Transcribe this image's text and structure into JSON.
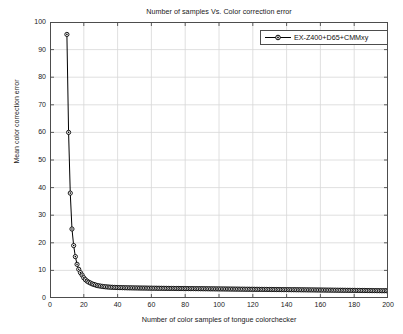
{
  "chart_data": {
    "type": "line",
    "title": "Number of samples Vs. Color correction error",
    "xlabel": "Number of color samples of tongue colorchecker",
    "ylabel": "Mean color correction error",
    "xlim": [
      0,
      200
    ],
    "ylim": [
      0,
      100
    ],
    "xticks": [
      0,
      20,
      40,
      60,
      80,
      100,
      120,
      140,
      160,
      180,
      200
    ],
    "yticks": [
      0,
      10,
      20,
      30,
      40,
      50,
      60,
      70,
      80,
      90,
      100
    ],
    "grid": "on",
    "legend_position": "top-right",
    "series": [
      {
        "name": "EX-Z400+D65+CMMxy",
        "color": "#000000",
        "marker": "circle",
        "line_style": "solid",
        "x": [
          10,
          11,
          12,
          13,
          14,
          15,
          16,
          17,
          18,
          19,
          20,
          21,
          22,
          23,
          24,
          25,
          26,
          27,
          28,
          29,
          30,
          31,
          32,
          33,
          34,
          35,
          36,
          37,
          38,
          39,
          40,
          41,
          42,
          43,
          44,
          45,
          46,
          47,
          48,
          49,
          50,
          51,
          52,
          53,
          54,
          55,
          56,
          57,
          58,
          59,
          60,
          61,
          62,
          63,
          64,
          65,
          66,
          67,
          68,
          69,
          70,
          71,
          72,
          73,
          74,
          75,
          76,
          77,
          78,
          79,
          80,
          81,
          82,
          83,
          84,
          85,
          86,
          87,
          88,
          89,
          90,
          91,
          92,
          93,
          94,
          95,
          96,
          97,
          98,
          99,
          100,
          101,
          102,
          103,
          104,
          105,
          106,
          107,
          108,
          109,
          110,
          111,
          112,
          113,
          114,
          115,
          116,
          117,
          118,
          119,
          120,
          121,
          122,
          123,
          124,
          125,
          126,
          127,
          128,
          129,
          130,
          131,
          132,
          133,
          134,
          135,
          136,
          137,
          138,
          139,
          140,
          141,
          142,
          143,
          144,
          145,
          146,
          147,
          148,
          149,
          150,
          151,
          152,
          153,
          154,
          155,
          156,
          157,
          158,
          159,
          160,
          161,
          162,
          163,
          164,
          165,
          166,
          167,
          168,
          169,
          170,
          171,
          172,
          173,
          174,
          175,
          176,
          177,
          178,
          179,
          180,
          181,
          182,
          183,
          184,
          185,
          186,
          187,
          188,
          189,
          190,
          191,
          192,
          193,
          194,
          195,
          196,
          197,
          198,
          199,
          200
        ],
        "y": [
          95.5,
          60.0,
          38.0,
          25.0,
          19.0,
          15.0,
          12.2,
          10.4,
          9.2,
          8.3,
          7.3,
          6.6,
          6.1,
          5.7,
          5.4,
          5.1,
          4.9,
          4.7,
          4.5,
          4.4,
          4.3,
          4.2,
          4.1,
          4.05,
          4.0,
          3.95,
          3.9,
          3.88,
          3.85,
          3.82,
          3.8,
          3.78,
          3.76,
          3.74,
          3.72,
          3.7,
          3.69,
          3.68,
          3.67,
          3.66,
          3.65,
          3.64,
          3.63,
          3.62,
          3.61,
          3.6,
          3.6,
          3.59,
          3.58,
          3.57,
          3.56,
          3.55,
          3.55,
          3.54,
          3.53,
          3.52,
          3.52,
          3.51,
          3.5,
          3.5,
          3.49,
          3.48,
          3.48,
          3.47,
          3.46,
          3.46,
          3.45,
          3.44,
          3.44,
          3.43,
          3.42,
          3.42,
          3.41,
          3.4,
          3.4,
          3.39,
          3.38,
          3.38,
          3.37,
          3.36,
          3.36,
          3.35,
          3.34,
          3.34,
          3.33,
          3.32,
          3.32,
          3.31,
          3.3,
          3.3,
          3.29,
          3.28,
          3.28,
          3.27,
          3.26,
          3.26,
          3.25,
          3.24,
          3.24,
          3.23,
          3.22,
          3.22,
          3.21,
          3.2,
          3.2,
          3.19,
          3.18,
          3.18,
          3.17,
          3.16,
          3.16,
          3.15,
          3.14,
          3.14,
          3.13,
          3.12,
          3.12,
          3.11,
          3.1,
          3.1,
          3.09,
          3.08,
          3.08,
          3.07,
          3.06,
          3.06,
          3.05,
          3.04,
          3.04,
          3.03,
          3.02,
          3.02,
          3.01,
          3.0,
          3.0,
          2.99,
          2.98,
          2.98,
          2.97,
          2.96,
          2.96,
          2.95,
          2.94,
          2.94,
          2.93,
          2.92,
          2.92,
          2.91,
          2.9,
          2.9,
          2.89,
          2.88,
          2.88,
          2.87,
          2.86,
          2.86,
          2.85,
          2.84,
          2.84,
          2.83,
          2.82,
          2.82,
          2.81,
          2.8,
          2.8,
          2.79,
          2.78,
          2.78,
          2.77,
          2.76,
          2.76,
          2.75,
          2.74,
          2.74,
          2.73,
          2.72,
          2.72,
          2.71,
          2.7,
          2.7,
          2.69,
          2.68,
          2.68,
          2.67,
          2.66,
          2.66,
          2.65,
          2.64,
          2.64,
          2.63,
          2.62
        ]
      }
    ]
  },
  "legend": {
    "entries": [
      {
        "label": "EX-Z400+D65+CMMxy"
      }
    ]
  },
  "axes": {
    "y_tick_labels": [
      "100",
      "90",
      "80",
      "70",
      "60",
      "50",
      "40",
      "30",
      "20",
      "10",
      "0"
    ],
    "x_tick_labels": [
      "0",
      "20",
      "40",
      "60",
      "80",
      "100",
      "120",
      "140",
      "160",
      "180",
      "200"
    ]
  },
  "colors": {
    "series": "#000000",
    "grid": "#d8d8d8",
    "axis": "#4d4d4d",
    "text": "#1a1a1a",
    "background": "#ffffff"
  }
}
